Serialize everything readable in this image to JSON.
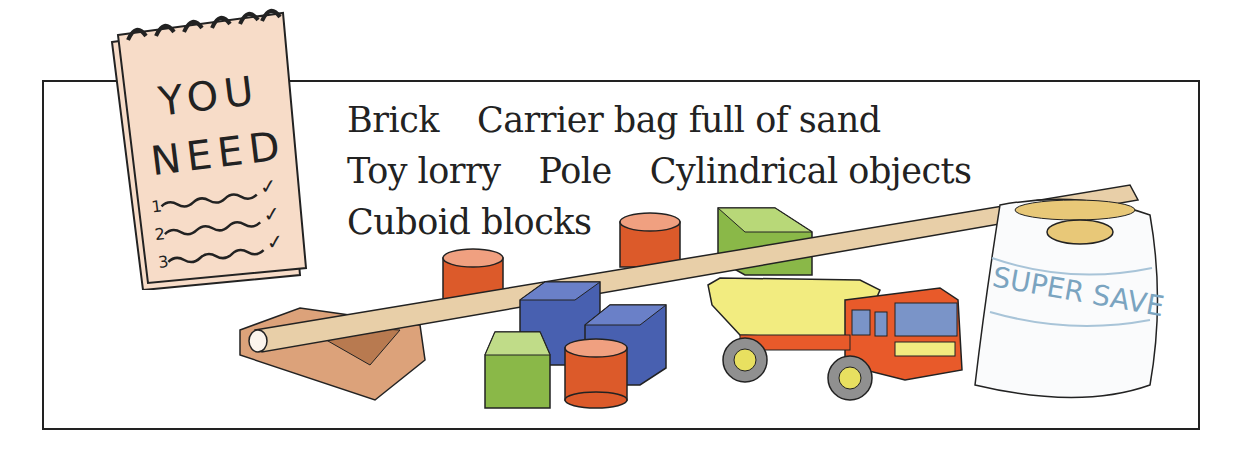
{
  "notepad": {
    "title_line1": "YOU",
    "title_line2": "NEED",
    "checklist": [
      {
        "number": "1",
        "checked": true
      },
      {
        "number": "2",
        "checked": true
      },
      {
        "number": "3",
        "checked": true
      }
    ],
    "check_glyph": "✓"
  },
  "items": {
    "rows": [
      [
        "Brick",
        "Carrier bag full of sand"
      ],
      [
        "Toy lorry",
        "Pole",
        "Cylindrical objects"
      ],
      [
        "Cuboid blocks"
      ]
    ]
  },
  "illustration": {
    "bag_label": "SUPER SAVE",
    "objects": [
      "pole",
      "brick",
      "orange-cylinder",
      "orange-cylinder",
      "orange-cylinder",
      "blue-cube",
      "blue-cube",
      "green-block",
      "green-block",
      "toy-lorry",
      "carrier-bag"
    ]
  },
  "colors": {
    "notepad_paper": "#f7dcc8",
    "cylinder": "#dc5a2a",
    "blue_block": "#4860b0",
    "green_block": "#8ab848",
    "pole": "#e8cfa8",
    "brick": "#dca27a",
    "lorry_body": "#f2ec80",
    "lorry_cab": "#e85a2a"
  }
}
